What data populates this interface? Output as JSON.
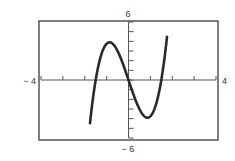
{
  "chart_data": {
    "type": "line",
    "title": "",
    "xlabel": "",
    "ylabel": "",
    "xlim": [
      -4,
      4
    ],
    "ylim": [
      -6,
      6
    ],
    "grid": false,
    "legend": null,
    "x_tick_step": 1,
    "y_tick_step": 1,
    "window_labels": {
      "xmin": "− 4",
      "xmax": "4",
      "ymin": "− 6",
      "ymax": "6"
    },
    "series": [
      {
        "name": "f(x)",
        "function_estimate": "3x^3 - 6.75x",
        "x": [
          -1.76,
          -1.5,
          -1.25,
          -1.0,
          -0.87,
          -0.75,
          -0.5,
          -0.25,
          0,
          0.25,
          0.5,
          0.75,
          0.87,
          1.0,
          1.25,
          1.5,
          1.76
        ],
        "y": [
          -4.48,
          0.0,
          2.58,
          3.75,
          3.9,
          3.8,
          3.0,
          1.64,
          0,
          -1.64,
          -3.0,
          -3.8,
          -3.9,
          -3.75,
          -2.58,
          0.0,
          4.48
        ]
      }
    ],
    "key_points": {
      "local_max": [
        -0.87,
        3.9
      ],
      "local_min": [
        0.87,
        -3.9
      ],
      "zeros": [
        -1.5,
        0,
        1.5
      ]
    }
  },
  "colors": {
    "curve": "#2a2a2a",
    "frame": "#3a3a3a",
    "axis": "#555555"
  }
}
